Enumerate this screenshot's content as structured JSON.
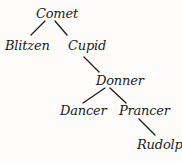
{
  "diagram": {
    "type": "binary-tree",
    "colors": {
      "background": "#fdfcfa",
      "text": "#1a1a1a",
      "edge": "#1a1a1a"
    },
    "nodes": {
      "comet": {
        "label": "Comet",
        "x": 36,
        "y": 7
      },
      "blitzen": {
        "label": "Blitzen",
        "x": 5,
        "y": 39
      },
      "cupid": {
        "label": "Cupid",
        "x": 68,
        "y": 39
      },
      "donner": {
        "label": "Donner",
        "x": 96,
        "y": 74
      },
      "dancer": {
        "label": "Dancer",
        "x": 60,
        "y": 104
      },
      "prancer": {
        "label": "Prancer",
        "x": 119,
        "y": 104
      },
      "rudolph": {
        "label": "Rudolph",
        "x": 137,
        "y": 138
      }
    },
    "edges": [
      {
        "from": "Comet",
        "to": "Blitzen",
        "x1": 45,
        "y1": 21,
        "x2": 31,
        "y2": 35
      },
      {
        "from": "Comet",
        "to": "Cupid",
        "x1": 55,
        "y1": 21,
        "x2": 67,
        "y2": 35
      },
      {
        "from": "Cupid",
        "to": "Donner",
        "x1": 84,
        "y1": 57,
        "x2": 99,
        "y2": 72
      },
      {
        "from": "Donner",
        "to": "Dancer",
        "x1": 105,
        "y1": 88,
        "x2": 83,
        "y2": 103
      },
      {
        "from": "Donner",
        "to": "Prancer",
        "x1": 110,
        "y1": 88,
        "x2": 126,
        "y2": 103
      },
      {
        "from": "Prancer",
        "to": "Rudolph",
        "x1": 139,
        "y1": 119,
        "x2": 155,
        "y2": 135
      }
    ]
  }
}
